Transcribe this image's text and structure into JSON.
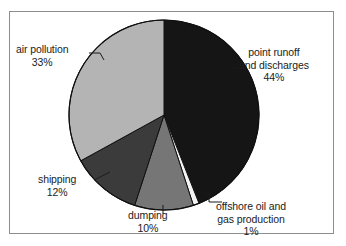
{
  "chart_data": {
    "type": "pie",
    "title": "",
    "subtitle": "",
    "xlabel": "",
    "ylabel": "",
    "legend_position": "none",
    "grid": false,
    "start_angle_deg": 0,
    "direction": "clockwise",
    "categories": [
      "point runoff and discharges",
      "offshore oil and gas production",
      "dumping",
      "shipping",
      "air pollution"
    ],
    "values": [
      44,
      1,
      10,
      12,
      33
    ],
    "units": "%",
    "slices": [
      {
        "label": "point runoff and discharges",
        "label_line1": "point runoff",
        "label_line2": "and discharges",
        "value": 44,
        "value_text": "44%",
        "color": "#151515",
        "leader": "dash-left"
      },
      {
        "label": "offshore oil and gas production",
        "label_line1": "offshore oil and",
        "label_line2": "gas production",
        "value": 1,
        "value_text": "1%",
        "color": "#f4f4f4",
        "leader": "elbow-up-left"
      },
      {
        "label": "dumping",
        "label_line1": "dumping",
        "label_line2": "",
        "value": 10,
        "value_text": "10%",
        "color": "#767676",
        "leader": "vertical-up"
      },
      {
        "label": "shipping",
        "label_line1": "shipping",
        "label_line2": "",
        "value": 12,
        "value_text": "12%",
        "color": "#3b3b3b",
        "leader": "dash-right"
      },
      {
        "label": "air pollution",
        "label_line1": "air pollution",
        "label_line2": "",
        "value": 33,
        "value_text": "33%",
        "color": "#b4b4b4",
        "leader": "hook-right"
      }
    ]
  },
  "figure": {
    "border_color": "#8d8d8d",
    "background": "#ffffff",
    "outline_color": "#101010"
  },
  "labels": {
    "air_pollution": {
      "name": "air pollution",
      "pct": "33%"
    },
    "point_runoff": {
      "line1": "point runoff",
      "line2": "and discharges",
      "pct": "44%"
    },
    "shipping": {
      "name": "shipping",
      "pct": "12%"
    },
    "dumping": {
      "name": "dumping",
      "pct": "10%"
    },
    "offshore": {
      "line1": "offshore oil and",
      "line2": "gas production",
      "pct": "1%"
    }
  }
}
